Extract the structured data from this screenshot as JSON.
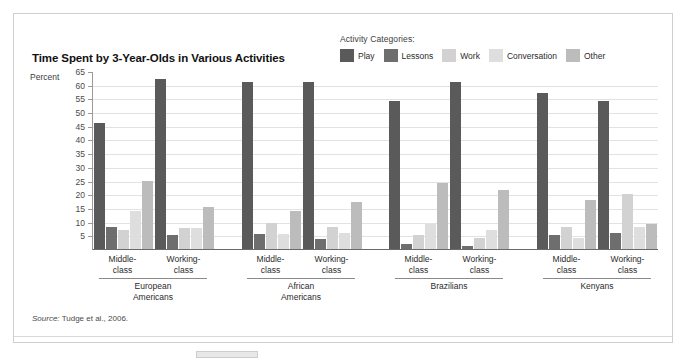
{
  "figure": {
    "title": "Time Spent by 3-Year-Olds in Various Activities",
    "y_axis_title": "Percent",
    "legend_title": "Activity Categories:",
    "source_prefix": "Source:",
    "source_text": " Tudge et al., 2006."
  },
  "colors": {
    "play": "#5a5a5a",
    "lessons": "#6e6e6e",
    "work": "#d2d2d2",
    "conversation": "#dedede",
    "other": "#bcbcbc",
    "gridline": "#e2e2e2",
    "axis": "#6a6a6a",
    "frame": "#cfcfcf"
  },
  "chart_data": {
    "type": "bar",
    "title": "Time Spent by 3-Year-Olds in Various Activities",
    "xlabel": "",
    "ylabel": "Percent",
    "ylim": [
      0,
      65
    ],
    "yticks": [
      65,
      60,
      55,
      50,
      45,
      40,
      35,
      30,
      25,
      20,
      15,
      10,
      5
    ],
    "grid": true,
    "legend_position": "top-right",
    "legend_title": "Activity Categories:",
    "series": [
      {
        "name": "Play",
        "color": "#5a5a5a",
        "values": [
          46,
          62,
          61,
          61,
          54,
          61,
          57,
          54
        ]
      },
      {
        "name": "Lessons",
        "color": "#6e6e6e",
        "values": [
          8,
          5,
          5.5,
          3.5,
          2,
          1,
          5,
          6
        ]
      },
      {
        "name": "Work",
        "color": "#d2d2d2",
        "values": [
          7,
          7.5,
          9.5,
          8,
          5,
          4,
          8,
          20
        ]
      },
      {
        "name": "Conversation",
        "color": "#dedede",
        "values": [
          14,
          7.5,
          5.5,
          6,
          9,
          7,
          4,
          8
        ]
      },
      {
        "name": "Other",
        "color": "#bcbcbc",
        "values": [
          25,
          15.5,
          14,
          17,
          24,
          21.5,
          18,
          9
        ]
      }
    ],
    "categories": [
      "European Americans Middle-class",
      "European Americans Working-class",
      "African Americans Middle-class",
      "African Americans Working-class",
      "Brazilians Middle-class",
      "Brazilians Working-class",
      "Kenyans Middle-class",
      "Kenyans Working-class"
    ],
    "groups": [
      {
        "name": "European\nAmericans",
        "name_line1": "European",
        "name_line2": "Americans",
        "subgroups": [
          "Middle-\nclass",
          "Working-\nclass"
        ]
      },
      {
        "name": "African\nAmericans",
        "name_line1": "African",
        "name_line2": "Americans",
        "subgroups": [
          "Middle-\nclass",
          "Working-\nclass"
        ]
      },
      {
        "name": "Brazilians",
        "name_line1": "Brazilians",
        "name_line2": "",
        "subgroups": [
          "Middle-\nclass",
          "Working-\nclass"
        ]
      },
      {
        "name": "Kenyans",
        "name_line1": "Kenyans",
        "name_line2": "",
        "subgroups": [
          "Middle-\nclass",
          "Working-\nclass"
        ]
      }
    ],
    "annotations": [
      "Source: Tudge et al., 2006."
    ]
  },
  "x_groups": [
    {
      "label_line1": "European",
      "label_line2": "Americans",
      "sub1_line1": "Middle-",
      "sub1_line2": "class",
      "sub2_line1": "Working-",
      "sub2_line2": "class"
    },
    {
      "label_line1": "African",
      "label_line2": "Americans",
      "sub1_line1": "Middle-",
      "sub1_line2": "class",
      "sub2_line1": "Working-",
      "sub2_line2": "class"
    },
    {
      "label_line1": "Brazilians",
      "label_line2": "",
      "sub1_line1": "Middle-",
      "sub1_line2": "class",
      "sub2_line1": "Working-",
      "sub2_line2": "class"
    },
    {
      "label_line1": "Kenyans",
      "label_line2": "",
      "sub1_line1": "Middle-",
      "sub1_line2": "class",
      "sub2_line1": "Working-",
      "sub2_line2": "class"
    }
  ]
}
